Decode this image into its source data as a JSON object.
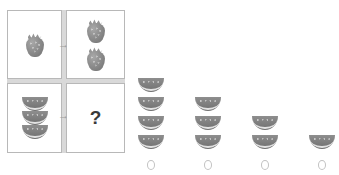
{
  "puzzle": {
    "type": "visual-analogy",
    "relation": "quantity doubling",
    "arrow_glyph": "→",
    "question_glyph": "?",
    "cells": {
      "top_left": {
        "fruit": "strawberry",
        "count": 1,
        "label": "1 strawberry"
      },
      "top_right": {
        "fruit": "strawberry",
        "count": 2,
        "label": "2 strawberries"
      },
      "bottom_left": {
        "fruit": "watermelon-slice",
        "count": 3,
        "label": "3 watermelon slices"
      },
      "bottom_right": {
        "fruit": "unknown",
        "count": null,
        "label": "?"
      }
    }
  },
  "options": [
    {
      "id": "A",
      "fruit": "watermelon-slice",
      "count": 4,
      "selected": false
    },
    {
      "id": "B",
      "fruit": "watermelon-slice",
      "count": 3,
      "selected": false
    },
    {
      "id": "C",
      "fruit": "watermelon-slice",
      "count": 2,
      "selected": false
    },
    {
      "id": "D",
      "fruit": "watermelon-slice",
      "count": 1,
      "selected": false
    }
  ],
  "colors": {
    "page_background": "#ffffff",
    "grid_gutter": "#d9d9d9",
    "cell_background": "#ffffff",
    "cell_border": "#b8b8b8",
    "arrow": "#9a9a9a",
    "question_mark": "#3a3a3a",
    "fruit_gray": "#7d7d7d",
    "radio_border": "#c2c2c2"
  }
}
